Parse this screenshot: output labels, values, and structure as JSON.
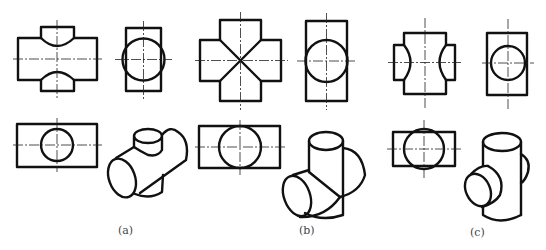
{
  "figure": {
    "panels": [
      {
        "id": "a",
        "caption": "(a)",
        "views": [
          "front",
          "side",
          "top",
          "isometric"
        ],
        "subject": "horizontal cylinder with smaller vertical cylinder passing through"
      },
      {
        "id": "b",
        "caption": "(b)",
        "views": [
          "front",
          "side",
          "top",
          "isometric"
        ],
        "subject": "two equal-diameter cylinders intersecting (cross)"
      },
      {
        "id": "c",
        "caption": "(c)",
        "views": [
          "front",
          "side",
          "top",
          "isometric"
        ],
        "subject": "vertical cylinder with smaller horizontal cylinder passing through"
      }
    ],
    "line_color": "#111111",
    "background": "#ffffff"
  }
}
